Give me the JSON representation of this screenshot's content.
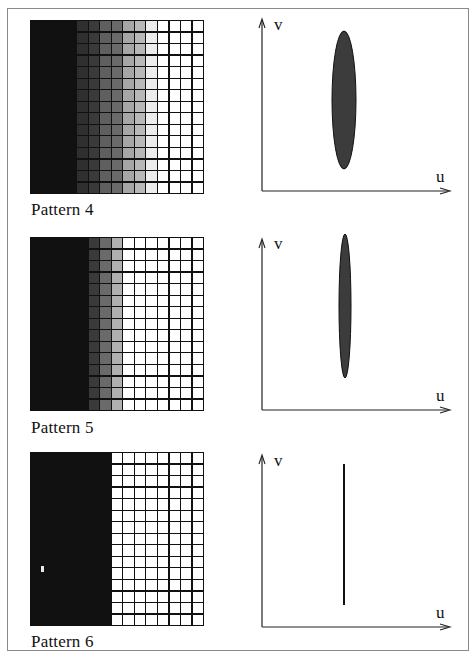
{
  "figure": {
    "border_color": "#8a8a8a",
    "grid_line_color": "#111111",
    "grid_size": {
      "rows": 15,
      "cols": 15
    }
  },
  "panels": [
    {
      "label": "Pattern 4",
      "column_shades": [
        "#111111",
        "#111111",
        "#111111",
        "#111111",
        "#2f2f2f",
        "#3a3a3a",
        "#5f5f5f",
        "#6a6a6a",
        "#a6a6a6",
        "#b8b8b8",
        "#ececec",
        "#ffffff",
        "#ffffff",
        "#ffffff",
        "#ffffff"
      ],
      "spectrum": {
        "shape": "ellipse",
        "fill": "#3c3c3c",
        "cx": 94,
        "cy": 92,
        "rx": 12,
        "ry": 69
      },
      "axes": {
        "x_label": "u",
        "y_label": "v"
      }
    },
    {
      "label": "Pattern 5",
      "column_shades": [
        "#111111",
        "#111111",
        "#111111",
        "#111111",
        "#111111",
        "#3a3a3a",
        "#6a6a6a",
        "#b0b0b0",
        "#ffffff",
        "#ffffff",
        "#ffffff",
        "#ffffff",
        "#ffffff",
        "#ffffff",
        "#ffffff"
      ],
      "spectrum": {
        "shape": "ellipse",
        "fill": "#3c3c3c",
        "cx": 95,
        "cy": 78,
        "rx": 6,
        "ry": 72
      },
      "axes": {
        "x_label": "u",
        "y_label": "v"
      }
    },
    {
      "label": "Pattern 6",
      "column_shades": [
        "#111111",
        "#111111",
        "#111111",
        "#111111",
        "#111111",
        "#111111",
        "#111111",
        "#ffffff",
        "#ffffff",
        "#ffffff",
        "#ffffff",
        "#ffffff",
        "#ffffff",
        "#ffffff",
        "#ffffff"
      ],
      "spectrum": {
        "shape": "line",
        "stroke": "#111111",
        "x": 94,
        "y1": 20,
        "y2": 161
      },
      "axes": {
        "x_label": "u",
        "y_label": "v"
      }
    }
  ]
}
